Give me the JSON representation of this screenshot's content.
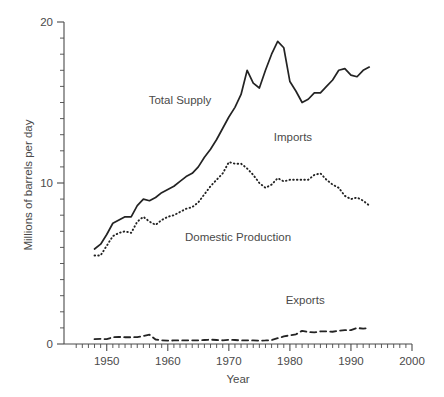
{
  "chart_data": {
    "type": "line",
    "title": "",
    "xlabel": "Year",
    "ylabel": "Millions of barrels per day",
    "xlim": [
      1943,
      2000
    ],
    "ylim": [
      0,
      20
    ],
    "grid": false,
    "legend": "inline-annotations",
    "x_ticks_major": [
      1950,
      1960,
      1970,
      1980,
      1990,
      2000
    ],
    "x_tick_labels": [
      "1950",
      "1960",
      "1970",
      "1980",
      "1990",
      "2000"
    ],
    "x_minor_step": 1,
    "y_ticks_major": [
      0,
      10,
      20
    ],
    "y_tick_labels": [
      "0",
      "10",
      "20"
    ],
    "y_minor_step": 1,
    "annotations": [
      {
        "text": "Total Supply",
        "x": 1962.0,
        "y": 14.9
      },
      {
        "text": "Imports",
        "x": 1980.5,
        "y": 12.6
      },
      {
        "text": "Domestic Production",
        "x": 1971.5,
        "y": 6.4
      },
      {
        "text": "Exports",
        "x": 1982.5,
        "y": 2.5
      }
    ],
    "series": [
      {
        "name": "Total Supply",
        "style": "solid",
        "x": [
          1948,
          1949,
          1950,
          1951,
          1952,
          1953,
          1954,
          1955,
          1956,
          1957,
          1958,
          1959,
          1960,
          1961,
          1962,
          1963,
          1964,
          1965,
          1966,
          1967,
          1968,
          1969,
          1970,
          1971,
          1972,
          1973,
          1974,
          1975,
          1976,
          1977,
          1978,
          1979,
          1980,
          1981,
          1982,
          1983,
          1984,
          1985,
          1986,
          1987,
          1988,
          1989,
          1990,
          1991,
          1992,
          1993
        ],
        "values": [
          5.9,
          6.2,
          6.8,
          7.5,
          7.7,
          7.9,
          7.9,
          8.6,
          9.0,
          8.9,
          9.1,
          9.4,
          9.6,
          9.8,
          10.1,
          10.4,
          10.6,
          11.0,
          11.6,
          12.1,
          12.7,
          13.4,
          14.1,
          14.7,
          15.5,
          17.0,
          16.2,
          15.9,
          17.0,
          18.0,
          18.8,
          18.4,
          16.3,
          15.7,
          15.0,
          15.2,
          15.6,
          15.6,
          16.0,
          16.4,
          17.0,
          17.1,
          16.7,
          16.6,
          17.0,
          17.2
        ]
      },
      {
        "name": "Domestic Production",
        "style": "dotted",
        "x": [
          1948,
          1949,
          1950,
          1951,
          1952,
          1953,
          1954,
          1955,
          1956,
          1957,
          1958,
          1959,
          1960,
          1961,
          1962,
          1963,
          1964,
          1965,
          1966,
          1967,
          1968,
          1969,
          1970,
          1971,
          1972,
          1973,
          1974,
          1975,
          1976,
          1977,
          1978,
          1979,
          1980,
          1981,
          1982,
          1983,
          1984,
          1985,
          1986,
          1987,
          1988,
          1989,
          1990,
          1991,
          1992,
          1993
        ],
        "values": [
          5.5,
          5.5,
          6.1,
          6.7,
          6.9,
          7.0,
          6.9,
          7.6,
          7.9,
          7.6,
          7.4,
          7.7,
          7.9,
          8.0,
          8.2,
          8.4,
          8.5,
          8.8,
          9.3,
          9.8,
          10.2,
          10.6,
          11.3,
          11.2,
          11.2,
          10.9,
          10.5,
          10.0,
          9.7,
          9.9,
          10.3,
          10.1,
          10.2,
          10.2,
          10.2,
          10.2,
          10.5,
          10.6,
          10.2,
          9.9,
          9.7,
          9.2,
          9.0,
          9.1,
          8.9,
          8.6
        ]
      },
      {
        "name": "Exports",
        "style": "dashed",
        "x": [
          1948,
          1949,
          1950,
          1951,
          1952,
          1953,
          1954,
          1955,
          1956,
          1957,
          1958,
          1959,
          1960,
          1961,
          1962,
          1963,
          1964,
          1965,
          1966,
          1967,
          1968,
          1969,
          1970,
          1971,
          1972,
          1973,
          1974,
          1975,
          1976,
          1977,
          1978,
          1979,
          1980,
          1981,
          1982,
          1983,
          1984,
          1985,
          1986,
          1987,
          1988,
          1989,
          1990,
          1991,
          1992,
          1993
        ],
        "values": [
          0.3,
          0.32,
          0.3,
          0.42,
          0.44,
          0.42,
          0.42,
          0.43,
          0.5,
          0.58,
          0.28,
          0.23,
          0.21,
          0.22,
          0.22,
          0.23,
          0.23,
          0.23,
          0.25,
          0.27,
          0.25,
          0.23,
          0.26,
          0.25,
          0.22,
          0.23,
          0.22,
          0.21,
          0.22,
          0.24,
          0.36,
          0.47,
          0.54,
          0.6,
          0.82,
          0.74,
          0.72,
          0.78,
          0.79,
          0.76,
          0.82,
          0.86,
          0.86,
          1.0,
          0.95,
          1.0
        ]
      }
    ]
  },
  "axes": {
    "y_title": "Millions of barrels per day",
    "x_title": "Year"
  }
}
